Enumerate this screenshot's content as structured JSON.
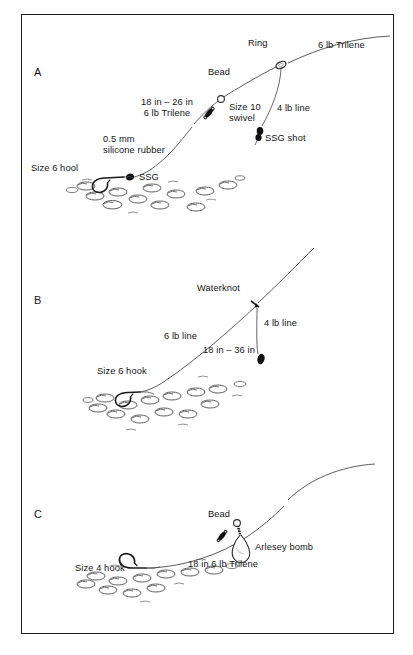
{
  "figure": {
    "background_color": "#ffffff",
    "ink_color": "#1a1a1a",
    "frame_border_color": "#1c1c1c"
  },
  "panels": [
    {
      "letter": "A",
      "name": "link-leger-rig",
      "labels": {
        "main_line": "6 lb Trilene",
        "ring": "Ring",
        "bead": "Bead",
        "hook_link": "18 in – 26 in\n6 lb Trilene",
        "swivel": "Size 10\nswivel",
        "dropper_line": "4 lb line",
        "shot": "SSG shot",
        "silicone": "0.5 mm\nsilicone rubber",
        "hook": "Size 6 hool",
        "hook_shot": "SSG"
      }
    },
    {
      "letter": "B",
      "name": "waterknot-paternoster-rig",
      "labels": {
        "knot": "Waterknot",
        "dropper_line": "4 lb line",
        "main_line": "6 lb line",
        "hook_length": "18 in – 36 in",
        "hook": "Size 6 hook"
      }
    },
    {
      "letter": "C",
      "name": "arlesey-bomb-leger-rig",
      "labels": {
        "bead": "Bead",
        "bomb": "Arlesey bomb",
        "hook_link": "18 in 6 lb Trilene",
        "hook": "Size 4 hook"
      }
    }
  ]
}
